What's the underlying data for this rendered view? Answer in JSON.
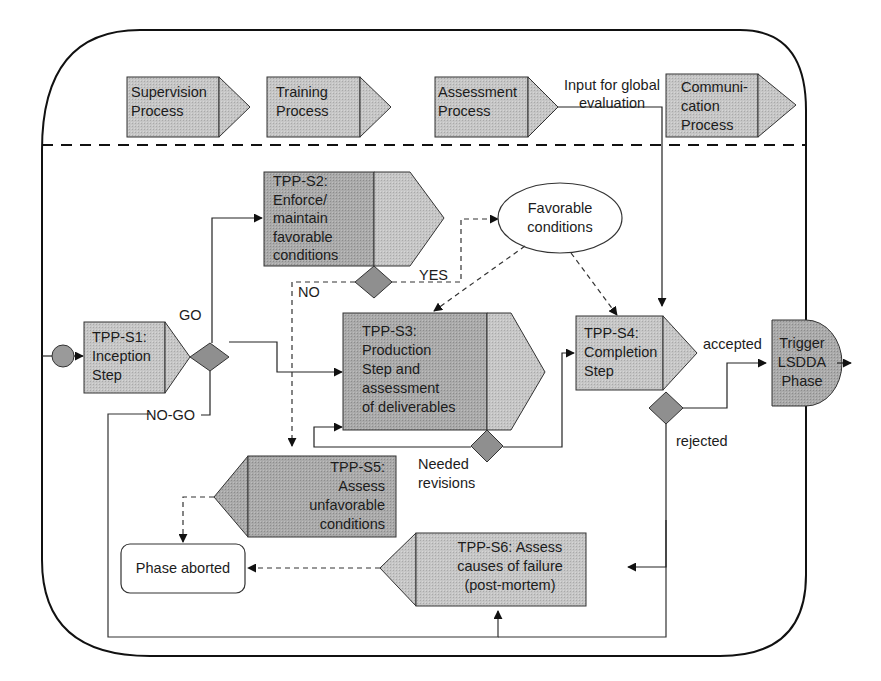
{
  "diagram": {
    "colors": {
      "box_fill": "#c4c4c4",
      "box_dark_fill": "#a8a8a8",
      "diamond_fill": "#8f8f8f",
      "start_circle_fill": "#9a9a9a",
      "stroke": "#222222"
    },
    "support_processes": [
      {
        "id": "supervision",
        "label": "Supervision\nProcess"
      },
      {
        "id": "training",
        "label": "Training\nProcess"
      },
      {
        "id": "assessment",
        "label": "Assessment\nProcess"
      },
      {
        "id": "communication",
        "label": "Communi-\ncation\nProcess"
      }
    ],
    "input_global_label": "Input for global\nevaluation",
    "steps": {
      "s1": {
        "label": "TPP-S1:\nInception\nStep"
      },
      "s2": {
        "label": "TPP-S2:\nEnforce/\nmaintain\nfavorable\nconditions"
      },
      "s3": {
        "label": "TPP-S3:\nProduction\nStep and\nassessment\nof deliverables"
      },
      "s4": {
        "label": "TPP-S4:\nCompletion\nStep"
      },
      "s5": {
        "label": "TPP-S5:\nAssess\nunfavorable\nconditions"
      },
      "s6": {
        "label": "TPP-S6: Assess\ncauses of failure\n(post-mortem)"
      }
    },
    "favorable_conditions": "Favorable\nconditions",
    "phase_aborted": "Phase aborted",
    "trigger": "Trigger\nLSDDA\nPhase",
    "edge_labels": {
      "go": "GO",
      "no_go": "NO-GO",
      "yes": "YES",
      "no": "NO",
      "accepted": "accepted",
      "rejected": "rejected",
      "needed_revisions": "Needed\nrevisions"
    }
  }
}
